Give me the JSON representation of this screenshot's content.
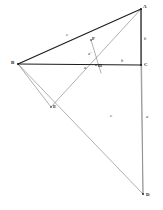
{
  "figure": {
    "canvas": {
      "width": 163,
      "height": 210
    },
    "ink_color": "#1c1c1c",
    "thin_color": "#6e6e6e",
    "background": "#ffffff",
    "points": [
      {
        "id": "A",
        "label": "A",
        "x": 141,
        "y": 9,
        "label_x": 143,
        "label_y": 4
      },
      {
        "id": "B",
        "label": "B",
        "x": 18,
        "y": 64,
        "label_x": 11,
        "label_y": 60
      },
      {
        "id": "C",
        "label": "C",
        "x": 141,
        "y": 65,
        "label_x": 144,
        "label_y": 62
      },
      {
        "id": "D",
        "label": "D",
        "x": 143,
        "y": 194,
        "label_x": 146,
        "label_y": 192
      },
      {
        "id": "E",
        "label": "E",
        "x": 51,
        "y": 107,
        "label_x": 53,
        "label_y": 104
      },
      {
        "id": "F",
        "label": "F",
        "x": 91,
        "y": 40,
        "label_x": 92,
        "label_y": 36
      },
      {
        "id": "H",
        "label": "H",
        "x": 96,
        "y": 65,
        "label_x": 98,
        "label_y": 63
      }
    ],
    "segments": [
      {
        "id": "BA",
        "from": "B",
        "to": "A",
        "weight": "heavy"
      },
      {
        "id": "BC",
        "from": "B",
        "to": "C",
        "weight": "heavy"
      },
      {
        "id": "AC",
        "from": "A",
        "to": "C",
        "weight": "heavy"
      },
      {
        "id": "CD",
        "from": "C",
        "to": "D",
        "weight": "thin"
      },
      {
        "id": "AD",
        "from": "A",
        "to": "D",
        "weight": "thin"
      },
      {
        "id": "BD",
        "from": "B",
        "to": "D",
        "weight": "thin"
      },
      {
        "id": "AE",
        "from": "A",
        "to": "E",
        "weight": "thin"
      },
      {
        "id": "BE",
        "from": "B",
        "to": "E",
        "weight": "thin"
      },
      {
        "id": "FH",
        "from": "F",
        "to": "H",
        "weight": "thin"
      }
    ],
    "segment_labels": [
      {
        "id": "c",
        "text": "c",
        "x": 66,
        "y": 33
      },
      {
        "id": "b-side",
        "text": "b",
        "x": 144,
        "y": 37
      },
      {
        "id": "b-base",
        "text": "b",
        "x": 121,
        "y": 59
      },
      {
        "id": "a-left",
        "text": "a",
        "x": 84,
        "y": 66
      },
      {
        "id": "a-prime",
        "text": "a'",
        "x": 88,
        "y": 52
      },
      {
        "id": "c-mid",
        "text": "c",
        "x": 110,
        "y": 114
      },
      {
        "id": "a-right",
        "text": "a",
        "x": 146,
        "y": 115
      }
    ]
  }
}
